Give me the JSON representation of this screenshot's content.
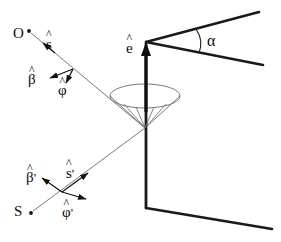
{
  "figure": {
    "background": "#ffffff",
    "stroke_dark": "#1a1a1a",
    "stroke_thin": "#5a5a5a",
    "text_color": "#0b0b0b",
    "width": 281,
    "height": 242
  },
  "labels": {
    "observer_point": "O",
    "source_point": "S",
    "s_hat": "s",
    "s_hat_prime": "s",
    "beta_hat": "β",
    "beta_hat_prime": "β",
    "phi_hat": "φ",
    "phi_hat_prime": "φ",
    "e_hat": "e",
    "alpha": "α",
    "hat_mark": "^",
    "prime_mark": "'"
  },
  "geometry": {
    "observer_dot": [
      28,
      31
    ],
    "source_dot": [
      30,
      212
    ],
    "cone_apex": [
      145,
      128
    ],
    "wedge_corner": [
      146,
      42
    ],
    "wedge_bottom_corner": [
      146,
      208
    ],
    "ellipse_center": [
      145,
      96
    ],
    "ellipse_rx": 35,
    "ellipse_ry": 12,
    "alpha_arc_label_pos": [
      213,
      41
    ]
  }
}
